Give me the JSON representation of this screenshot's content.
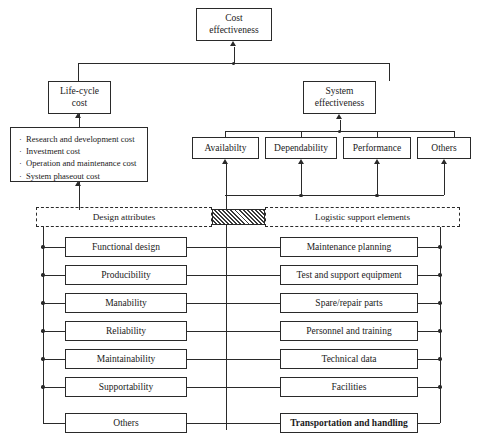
{
  "diagram": {
    "title_box": {
      "line1": "Cost",
      "line2": "effectiveness"
    },
    "branches": {
      "life_cycle": {
        "line1": "Life-cycle",
        "line2": "cost"
      },
      "system_eff": {
        "line1": "System",
        "line2": "effectiveness"
      }
    },
    "cost_items": [
      "Research and development cost",
      "Investment cost",
      "Operation and maintenance cost",
      "System phaseout cost"
    ],
    "effectiveness_factors": [
      "Availabilty",
      "Dependability",
      "Performance",
      "Others"
    ],
    "group_labels": {
      "left": "Design attributes",
      "right": "Logistic support elements"
    },
    "design_attributes": [
      "Functional design",
      "Producibility",
      "Manability",
      "Reliability",
      "Maintainability",
      "Supportability",
      "Others"
    ],
    "logistic_support_elements": [
      "Maintenance planning",
      "Test and support equipment",
      "Spare/repair parts",
      "Personnel and training",
      "Technical data",
      "Facilities",
      "Transportation and handling"
    ]
  }
}
